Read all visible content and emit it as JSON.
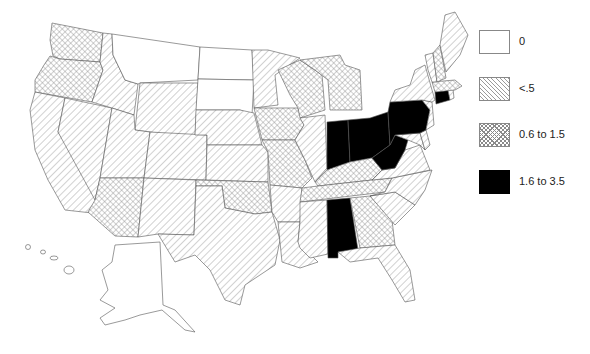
{
  "map": {
    "title": "",
    "region": "United States",
    "legend": [
      {
        "id": "zero",
        "label": "0",
        "fill": "white"
      },
      {
        "id": "low",
        "label": "<.5",
        "fill": "diagonal-hatch"
      },
      {
        "id": "mid",
        "label": "0.6 to 1.5",
        "fill": "cross-hatch"
      },
      {
        "id": "high",
        "label": "1.6 to 3.5",
        "fill": "#000000"
      }
    ],
    "states": {
      "WA": "mid",
      "OR": "mid",
      "CA": "low",
      "NV": "low",
      "ID": "low",
      "MT": "zero",
      "WY": "low",
      "UT": "low",
      "AZ": "mid",
      "CO": "low",
      "NM": "low",
      "ND": "zero",
      "SD": "zero",
      "NE": "low",
      "KS": "low",
      "OK": "mid",
      "TX": "low",
      "MN": "low",
      "IA": "mid",
      "MO": "mid",
      "AR": "low",
      "LA": "low",
      "WI": "mid",
      "IL": "low",
      "MI": "mid",
      "IN": "high",
      "OH": "high",
      "KY": "mid",
      "TN": "mid",
      "MS": "low",
      "AL": "high",
      "GA": "mid",
      "FL": "low",
      "SC": "low",
      "NC": "low",
      "VA": "low",
      "WV": "high",
      "PA": "high",
      "NY": "low",
      "MD": "low",
      "DE": "low",
      "NJ": "low",
      "CT": "high",
      "RI": "low",
      "MA": "mid",
      "VT": "low",
      "NH": "mid",
      "ME": "low",
      "AK": "zero",
      "HI": "zero"
    }
  }
}
